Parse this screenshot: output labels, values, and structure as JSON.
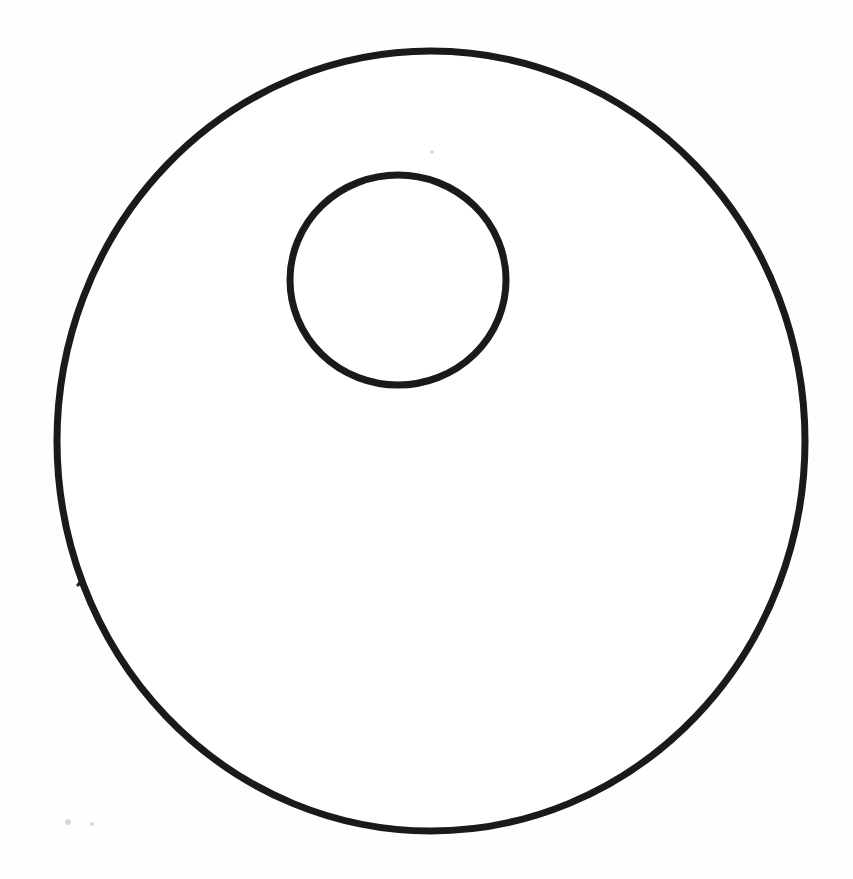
{
  "figure": {
    "title": "Radial segmented wheel diagram",
    "background_color": "#ffffff",
    "line_color": "#1a1a1a"
  },
  "outer_circle": {
    "name": "outer-rim",
    "center_x": 431,
    "center_y": 441,
    "radius_x": 374,
    "radius_y": 390,
    "stroke_width": 7,
    "color": "#1a1a1a",
    "bounds": {
      "left": 57,
      "right": 805,
      "top": 51,
      "bottom": 831
    }
  },
  "inner_circle": {
    "name": "inner-rim",
    "center_x": 398,
    "center_y": 280,
    "radius_x": 108,
    "radius_y": 105,
    "stroke_width": 7,
    "color": "#1a1a1a",
    "bounds": {
      "left": 290,
      "right": 506,
      "top": 175,
      "bottom": 385
    }
  },
  "spokes": {
    "count": 24,
    "stroke_width": 3.2,
    "color": "#1f1f1f",
    "note": "Each spoke runs from a point on the inner circle outward to the outer rim; angles measured in degrees clockwise from 12 o'clock",
    "angles_deg": [
      0,
      14,
      28,
      43,
      58,
      74,
      90,
      104,
      118,
      131,
      144,
      156,
      168,
      180,
      193,
      207,
      221,
      236,
      250,
      264,
      277,
      290,
      304,
      330
    ],
    "endpoints": [
      {
        "id": "spoke-01",
        "inner": [
          398,
          175
        ],
        "outer": [
          413,
          51
        ]
      },
      {
        "id": "spoke-02",
        "inner": [
          424,
          178
        ],
        "outer": [
          468,
          57
        ]
      },
      {
        "id": "spoke-03",
        "inner": [
          449,
          188
        ],
        "outer": [
          532,
          70
        ]
      },
      {
        "id": "spoke-04",
        "inner": [
          472,
          204
        ],
        "outer": [
          598,
          98
        ]
      },
      {
        "id": "spoke-05",
        "inner": [
          490,
          225
        ],
        "outer": [
          657,
          135
        ]
      },
      {
        "id": "spoke-06",
        "inner": [
          502,
          251
        ],
        "outer": [
          722,
          197
        ]
      },
      {
        "id": "spoke-07",
        "inner": [
          506,
          280
        ],
        "outer": [
          777,
          302
        ]
      },
      {
        "id": "spoke-08",
        "inner": [
          503,
          306
        ],
        "outer": [
          799,
          420
        ]
      },
      {
        "id": "spoke-09",
        "inner": [
          493,
          332
        ],
        "outer": [
          781,
          548
        ]
      },
      {
        "id": "spoke-10",
        "inner": [
          477,
          353
        ],
        "outer": [
          724,
          666
        ]
      },
      {
        "id": "spoke-11",
        "inner": [
          456,
          370
        ],
        "outer": [
          629,
          761
        ]
      },
      {
        "id": "spoke-12",
        "inner": [
          430,
          382
        ],
        "outer": [
          508,
          814
        ]
      },
      {
        "id": "spoke-13",
        "inner": [
          398,
          385
        ],
        "outer": [
          411,
          831
        ]
      },
      {
        "id": "spoke-14",
        "inner": [
          368,
          381
        ],
        "outer": [
          368,
          816
        ]
      },
      {
        "id": "spoke-15",
        "inner": [
          340,
          369
        ],
        "outer": [
          238,
          768
        ]
      },
      {
        "id": "spoke-16",
        "inner": [
          317,
          350
        ],
        "outer": [
          142,
          680
        ]
      },
      {
        "id": "spoke-17",
        "inner": [
          299,
          326
        ],
        "outer": [
          78,
          585
        ]
      },
      {
        "id": "spoke-18",
        "inner": [
          290,
          298
        ],
        "outer": [
          60,
          455
        ]
      },
      {
        "id": "spoke-19",
        "inner": [
          291,
          268
        ],
        "outer": [
          60,
          413
        ]
      },
      {
        "id": "spoke-20",
        "inner": [
          299,
          239
        ],
        "outer": [
          67,
          365
        ]
      },
      {
        "id": "spoke-21",
        "inner": [
          314,
          214
        ],
        "outer": [
          98,
          268
        ]
      },
      {
        "id": "spoke-22",
        "inner": [
          334,
          195
        ],
        "outer": [
          143,
          198
        ]
      },
      {
        "id": "spoke-23",
        "inner": [
          356,
          182
        ],
        "outer": [
          215,
          133
        ]
      },
      {
        "id": "spoke-24",
        "inner": [
          378,
          176
        ],
        "outer": [
          296,
          84
        ]
      }
    ]
  },
  "extra_spokes_top": {
    "note": "Additional fine spokes crowding the upper arc between 11 and 1 o'clock",
    "endpoints": [
      {
        "id": "spoke-t1",
        "inner": [
          388,
          175
        ],
        "outer": [
          355,
          63
        ]
      },
      {
        "id": "spoke-t2",
        "inner": [
          410,
          176
        ],
        "outer": [
          467,
          58
        ]
      },
      {
        "id": "spoke-t3",
        "inner": [
          437,
          182
        ],
        "outer": [
          510,
          65
        ]
      },
      {
        "id": "spoke-t4",
        "inner": [
          367,
          179
        ],
        "outer": [
          312,
          72
        ]
      },
      {
        "id": "spoke-t5",
        "inner": [
          347,
          187
        ],
        "outer": [
          258,
          95
        ]
      },
      {
        "id": "spoke-t6",
        "inner": [
          326,
          202
        ],
        "outer": [
          181,
          153
        ]
      },
      {
        "id": "spoke-t7",
        "inner": [
          307,
          222
        ],
        "outer": [
          120,
          228
        ]
      },
      {
        "id": "spoke-t8",
        "inner": [
          296,
          249
        ],
        "outer": [
          79,
          316
        ]
      }
    ]
  },
  "specks": [
    {
      "id": "speck-1",
      "x": 68,
      "y": 822,
      "r": 3
    },
    {
      "id": "speck-2",
      "x": 92,
      "y": 824,
      "r": 2
    },
    {
      "id": "speck-3",
      "x": 432,
      "y": 152,
      "r": 2
    }
  ]
}
